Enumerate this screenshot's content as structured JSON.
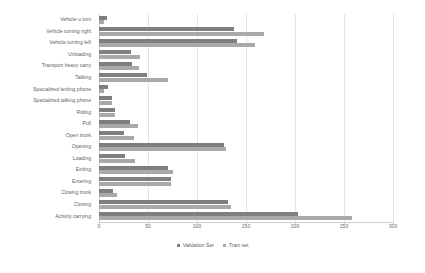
{
  "chart_data": {
    "type": "bar",
    "orientation": "horizontal",
    "title": "",
    "xlabel": "",
    "ylabel": "",
    "xlim": [
      0,
      300
    ],
    "xticks": [
      0,
      50,
      100,
      150,
      200,
      250,
      300
    ],
    "grid": true,
    "legend_position": "bottom",
    "categories": [
      "Vehicle u turn",
      "Vehicle turning right",
      "Vehicle turning left",
      "Unloading",
      "Transport heavy carry",
      "Talking",
      "Specialized texting phone",
      "Specialized talking phone",
      "Riding",
      "Pull",
      "Open trunk",
      "Opening",
      "Loading",
      "Exiting",
      "Entering",
      "Closing trunk",
      "Closing",
      "Activity carrying"
    ],
    "series": [
      {
        "name": "Validation Set",
        "color": "#7f7f7f",
        "values": [
          8,
          138,
          141,
          33,
          34,
          49,
          9,
          13,
          16,
          32,
          26,
          128,
          27,
          70,
          73,
          14,
          132,
          203
        ]
      },
      {
        "name": "Train set",
        "color": "#a9a9a9",
        "values": [
          5,
          168,
          159,
          42,
          41,
          70,
          5,
          13,
          16,
          40,
          36,
          130,
          37,
          76,
          73,
          18,
          135,
          258
        ]
      }
    ]
  },
  "legend": {
    "items": [
      {
        "label": "Validation Set",
        "swatch": "validation-swatch"
      },
      {
        "label": "Train set",
        "swatch": "train-swatch"
      }
    ]
  },
  "axis": {
    "x_tick_labels": [
      "0",
      "50",
      "100",
      "150",
      "200",
      "250",
      "300"
    ]
  }
}
